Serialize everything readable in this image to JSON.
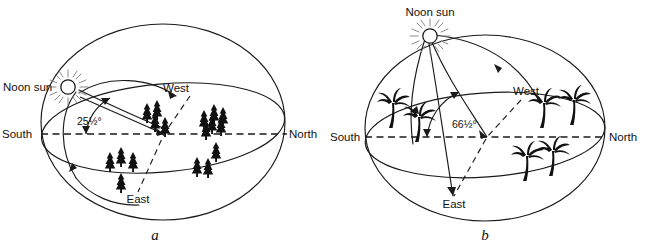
{
  "figure": {
    "background_color": "#ffffff",
    "line_color": "#1a1a1a",
    "panels": [
      {
        "id": "a",
        "letter": "a",
        "sun_label": "Noon sun",
        "angle_label": "25½°",
        "angle_value_degrees": 25.5,
        "vegetation": "conifer-trees",
        "directions": {
          "south": "South",
          "north": "North",
          "west": "West",
          "east": "East"
        },
        "sun_icon": "sun-icon"
      },
      {
        "id": "b",
        "letter": "b",
        "sun_label": "Noon sun",
        "angle_label": "66½°",
        "angle_value_degrees": 66.5,
        "vegetation": "palm-trees",
        "directions": {
          "south": "South",
          "north": "North",
          "west": "West",
          "east": "East"
        },
        "sun_icon": "sun-icon"
      }
    ]
  }
}
